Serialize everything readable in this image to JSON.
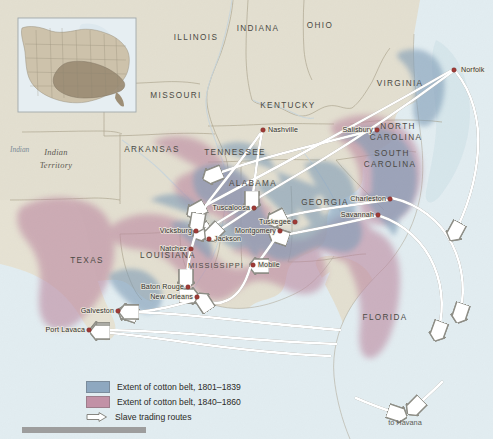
{
  "map": {
    "title": "Extent of the cotton belt and slave trading routes, 1801-1860",
    "colors": {
      "land": "#e4e0d2",
      "land_alt": "#d9d7c4",
      "ocean": "#dfe9ee",
      "cotton_1801_1839": "#8ea8c0",
      "cotton_1840_1860": "#c291a6",
      "city_dot": "#a03b36",
      "route_line": "#ffffff",
      "route_outline": "#9a9a92",
      "border": "#a39e8c",
      "inset_highlight": "#9a8b73",
      "inset_land": "#cfc4ad"
    },
    "states": [
      {
        "name": "ILLINOIS",
        "x": 196,
        "y": 40
      },
      {
        "name": "INDIANA",
        "x": 258,
        "y": 31
      },
      {
        "name": "OHIO",
        "x": 320,
        "y": 28
      },
      {
        "name": "MISSOURI",
        "x": 176,
        "y": 98
      },
      {
        "name": "KENTUCKY",
        "x": 288,
        "y": 108
      },
      {
        "name": "VIRGINIA",
        "x": 400,
        "y": 86
      },
      {
        "name": "ARKANSAS",
        "x": 152,
        "y": 152
      },
      {
        "name": "TENNESSEE",
        "x": 235,
        "y": 155
      },
      {
        "name": "NORTH",
        "x": 398,
        "y": 129
      },
      {
        "name": "CAROLINA",
        "x": 396,
        "y": 140
      },
      {
        "name": "SOUTH",
        "x": 392,
        "y": 156
      },
      {
        "name": "CAROLINA",
        "x": 390,
        "y": 167
      },
      {
        "name": "ALABAMA",
        "x": 253,
        "y": 186
      },
      {
        "name": "GEORGIA",
        "x": 325,
        "y": 205
      },
      {
        "name": "TEXAS",
        "x": 87,
        "y": 263
      },
      {
        "name": "LOUISIANA",
        "x": 168,
        "y": 258
      },
      {
        "name": "MISSISSIPPI",
        "x": 216,
        "y": 268
      },
      {
        "name": "FLORIDA",
        "x": 385,
        "y": 320
      }
    ],
    "territory_label": {
      "name": "Indian Territory",
      "line1": "Indian",
      "line2": "Territory",
      "x": 56,
      "y": 155
    },
    "ocean_label": {
      "name": "Indian",
      "text": "Indian",
      "x": 14,
      "y": 152
    },
    "cities": [
      {
        "name": "Norfolk",
        "label": "Norfolk",
        "dx": 454,
        "dy": 70,
        "lx": 461,
        "ly": 70,
        "anchor": "start"
      },
      {
        "name": "Salisbury",
        "label": "Salisbury",
        "dx": 377,
        "dy": 130,
        "lx": 373,
        "ly": 130,
        "anchor": "end"
      },
      {
        "name": "Nashville",
        "label": "Nashville",
        "dx": 263,
        "dy": 130,
        "lx": 268,
        "ly": 130,
        "anchor": "start"
      },
      {
        "name": "Charleston",
        "label": "Charleston",
        "dx": 390,
        "dy": 199,
        "lx": 386,
        "ly": 199,
        "anchor": "end"
      },
      {
        "name": "Savannah",
        "label": "Savannah",
        "dx": 378,
        "dy": 215,
        "lx": 374,
        "ly": 215,
        "anchor": "end"
      },
      {
        "name": "Tuscaloosa",
        "label": "Tuscaloosa",
        "dx": 254,
        "dy": 208,
        "lx": 250,
        "ly": 208,
        "anchor": "end"
      },
      {
        "name": "Tuskegee",
        "label": "Tuskegee",
        "dx": 295,
        "dy": 222,
        "lx": 291,
        "ly": 222,
        "anchor": "end"
      },
      {
        "name": "Montgomery",
        "label": "Montgomery",
        "dx": 280,
        "dy": 231,
        "lx": 276,
        "ly": 231,
        "anchor": "end"
      },
      {
        "name": "Vicksburg",
        "label": "Vicksburg",
        "dx": 196,
        "dy": 231,
        "lx": 192,
        "ly": 231,
        "anchor": "end"
      },
      {
        "name": "Jackson",
        "label": "Jackson",
        "dx": 209,
        "dy": 239,
        "lx": 214,
        "ly": 239,
        "anchor": "start"
      },
      {
        "name": "Natchez",
        "label": "Natchez",
        "dx": 191,
        "dy": 249,
        "lx": 187,
        "ly": 249,
        "anchor": "end"
      },
      {
        "name": "Mobile",
        "label": "Mobile",
        "dx": 253,
        "dy": 265,
        "lx": 258,
        "ly": 265,
        "anchor": "start"
      },
      {
        "name": "Baton Rouge",
        "label": "Baton Rouge",
        "dx": 188,
        "dy": 287,
        "lx": 184,
        "ly": 287,
        "anchor": "end"
      },
      {
        "name": "New Orleans",
        "label": "New Orleans",
        "dx": 197,
        "dy": 297,
        "lx": 193,
        "ly": 297,
        "anchor": "end"
      },
      {
        "name": "Galveston",
        "label": "Galveston",
        "dx": 118,
        "dy": 311,
        "lx": 114,
        "ly": 311,
        "anchor": "end"
      },
      {
        "name": "Port Lavaca",
        "label": "Port Lavaca",
        "dx": 89,
        "dy": 330,
        "lx": 85,
        "ly": 330,
        "anchor": "end"
      }
    ],
    "havana_label": {
      "text": "to Havana",
      "x": 405,
      "y": 425
    }
  },
  "legend": {
    "items": [
      {
        "type": "swatch",
        "color": "#8ea8c0",
        "label": "Extent of cotton belt, 1801–1839"
      },
      {
        "type": "swatch",
        "color": "#c291a6",
        "label": "Extent of cotton belt, 1840–1860"
      },
      {
        "type": "arrow",
        "color": "#ffffff",
        "label": "Slave trading routes"
      }
    ]
  },
  "inset": {
    "name": "united-states-locator-inset",
    "x": 18,
    "y": 18,
    "width": 118,
    "height": 94
  }
}
